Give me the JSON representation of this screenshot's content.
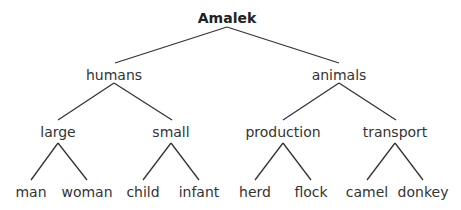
{
  "diagram": {
    "type": "tree",
    "root": {
      "label": "Amalek",
      "children": [
        {
          "label": "humans",
          "children": [
            {
              "label": "large",
              "children": [
                {
                  "label": "man"
                },
                {
                  "label": "woman"
                }
              ]
            },
            {
              "label": "small",
              "children": [
                {
                  "label": "child"
                },
                {
                  "label": "infant"
                }
              ]
            }
          ]
        },
        {
          "label": "animals",
          "children": [
            {
              "label": "production",
              "children": [
                {
                  "label": "herd"
                },
                {
                  "label": "flock"
                }
              ]
            },
            {
              "label": "transport",
              "children": [
                {
                  "label": "camel"
                },
                {
                  "label": "donkey"
                }
              ]
            }
          ]
        }
      ]
    },
    "colors": {
      "line": "#333333",
      "text": "#333333",
      "background": "#ffffff"
    }
  }
}
